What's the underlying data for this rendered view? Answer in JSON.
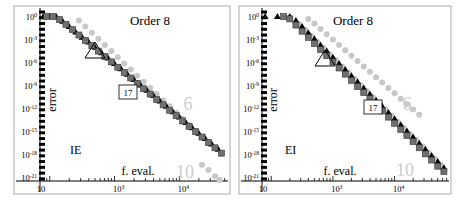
{
  "chart_data": [
    {
      "type": "scatter",
      "title": "Order 8",
      "method_label": "IE",
      "xlabel": "f. eval.",
      "ylabel": "error",
      "xscale": "log",
      "yscale": "log",
      "x_ticks": [
        "10",
        "10^3",
        "10^4"
      ],
      "y_ticks": [
        "10^0",
        "10^-3",
        "10^-6",
        "10^-9",
        "10^-12",
        "10^-15",
        "10^-18",
        "10^-21"
      ],
      "annotations": [
        {
          "text": "6",
          "kind": "gray-label"
        },
        {
          "text": "10",
          "kind": "gray-label"
        },
        {
          "text": "17",
          "kind": "boxed-label"
        },
        {
          "text": "",
          "kind": "triangle-marker"
        }
      ],
      "series": [
        {
          "name": "gray circles (order 6)",
          "marker": "circle",
          "color": "#c8c8c8",
          "log10_x": [
            2.45,
            2.55,
            2.65,
            2.75,
            2.85,
            2.95,
            3.05,
            3.15,
            3.25,
            3.35,
            3.45,
            3.55,
            3.65,
            3.75,
            3.85,
            3.95,
            4.05,
            4.15,
            4.25,
            4.35,
            4.45
          ],
          "log10_y": [
            -0.5,
            -1.3,
            -2.1,
            -2.9,
            -3.7,
            -4.5,
            -5.3,
            -6.1,
            -6.9,
            -7.7,
            -8.5,
            -9.3,
            -10.1,
            -10.9,
            -11.7,
            -12.5,
            -13.3,
            -14.1,
            -14.9,
            -15.7,
            -16.5
          ]
        },
        {
          "name": "gray circles (order 10)",
          "marker": "circle",
          "color": "#c8c8c8",
          "log10_x": [
            4.35,
            4.45,
            4.55,
            4.62
          ],
          "log10_y": [
            -19.3,
            -20.0,
            -20.8,
            -21.3
          ]
        },
        {
          "name": "black triangles",
          "marker": "triangle",
          "color": "#000000",
          "log10_x": [
            1.9,
            2.0,
            2.1,
            2.2,
            2.3,
            2.4,
            2.5,
            2.6,
            2.7,
            2.8,
            2.9,
            3.0,
            3.1,
            3.2,
            3.3,
            3.4,
            3.5,
            3.6,
            3.7,
            3.8,
            3.9,
            4.0,
            4.1,
            4.2,
            4.3,
            4.4,
            4.5,
            4.6
          ],
          "log10_y": [
            0,
            0,
            0,
            -0.6,
            -1.3,
            -2.0,
            -2.7,
            -3.3,
            -4.0,
            -4.7,
            -5.4,
            -6.1,
            -6.8,
            -7.5,
            -8.2,
            -8.9,
            -9.6,
            -10.3,
            -11.0,
            -11.7,
            -12.4,
            -13.1,
            -13.8,
            -14.5,
            -15.2,
            -15.9,
            -16.6,
            -17.3
          ]
        },
        {
          "name": "dark gray squares",
          "marker": "square",
          "color": "#707070",
          "log10_x": [
            1.95,
            2.05,
            2.15,
            2.25,
            2.35,
            2.45,
            2.55,
            2.65,
            2.75,
            2.85,
            2.95,
            3.05,
            3.15,
            3.25,
            3.35,
            3.45,
            3.55,
            3.65,
            3.75,
            3.85,
            3.95,
            4.05,
            4.15,
            4.25,
            4.35,
            4.45,
            4.55,
            4.65
          ],
          "log10_y": [
            0,
            0,
            -0.4,
            -1.0,
            -1.7,
            -2.4,
            -3.1,
            -3.8,
            -4.5,
            -5.2,
            -5.9,
            -6.6,
            -7.3,
            -8.0,
            -8.7,
            -9.4,
            -10.1,
            -10.8,
            -11.5,
            -12.2,
            -12.9,
            -13.6,
            -14.3,
            -15.0,
            -15.7,
            -16.4,
            -17.1,
            -17.8
          ]
        }
      ]
    },
    {
      "type": "scatter",
      "title": "Order 8",
      "method_label": "EI",
      "xlabel": "f. eval.",
      "ylabel": "error",
      "xscale": "log",
      "yscale": "log",
      "x_ticks": [
        "10",
        "10^3",
        "10^4"
      ],
      "y_ticks": [
        "10^0",
        "10^-3",
        "10^-6",
        "10^-9",
        "10^-12",
        "10^-15",
        "10^-18",
        "10^-21"
      ],
      "annotations": [
        {
          "text": "6",
          "kind": "gray-label"
        },
        {
          "text": "10",
          "kind": "gray-label"
        },
        {
          "text": "17",
          "kind": "boxed-label"
        },
        {
          "text": "",
          "kind": "triangle-marker"
        }
      ],
      "series": [
        {
          "name": "gray circles (order 6)",
          "marker": "circle",
          "color": "#c8c8c8",
          "log10_x": [
            2.6,
            2.7,
            2.8,
            2.9,
            3.0,
            3.1,
            3.2,
            3.3,
            3.4,
            3.5,
            3.6,
            3.7,
            3.8,
            3.9,
            4.0,
            4.1,
            4.2,
            4.3,
            4.4
          ],
          "log10_y": [
            -0.3,
            -0.9,
            -1.6,
            -2.3,
            -3.0,
            -3.7,
            -4.4,
            -5.1,
            -5.8,
            -6.5,
            -7.2,
            -7.9,
            -8.6,
            -9.3,
            -10.0,
            -10.7,
            -11.4,
            -12.1,
            -12.8
          ]
        },
        {
          "name": "gray circles (order 10)",
          "marker": "circle",
          "color": "#c8c8c8",
          "log10_x": [
            2.45,
            2.55,
            2.65,
            2.75,
            2.85,
            2.95,
            3.05,
            3.15,
            3.25,
            3.35,
            3.45,
            3.55,
            3.65,
            3.75,
            3.85,
            3.95,
            4.05,
            4.15,
            4.25,
            4.35,
            4.45,
            4.55,
            4.65,
            4.75
          ],
          "log10_y": [
            -1.0,
            -1.7,
            -2.5,
            -3.3,
            -4.1,
            -4.9,
            -5.7,
            -6.5,
            -7.3,
            -8.1,
            -8.9,
            -9.7,
            -10.5,
            -11.3,
            -12.1,
            -12.9,
            -13.7,
            -14.5,
            -15.3,
            -16.1,
            -16.9,
            -17.7,
            -18.5,
            -19.3
          ]
        },
        {
          "name": "black triangles",
          "marker": "triangle",
          "color": "#000000",
          "log10_x": [
            1.9,
            2.1,
            2.3,
            2.4,
            2.5,
            2.6,
            2.7,
            2.8,
            2.9,
            3.0,
            3.1,
            3.2,
            3.3,
            3.4,
            3.5,
            3.6,
            3.7,
            3.8,
            3.9,
            4.0,
            4.1,
            4.2,
            4.3,
            4.4,
            4.5,
            4.6,
            4.7,
            4.8
          ],
          "log10_y": [
            0,
            0,
            0,
            -0.5,
            -1.3,
            -2.1,
            -2.9,
            -3.7,
            -4.5,
            -5.3,
            -6.1,
            -6.9,
            -7.7,
            -8.5,
            -9.3,
            -10.1,
            -10.9,
            -11.7,
            -12.5,
            -13.3,
            -14.1,
            -14.9,
            -15.7,
            -16.5,
            -17.3,
            -18.1,
            -18.9,
            -19.7
          ]
        },
        {
          "name": "dark gray squares",
          "marker": "square",
          "color": "#707070",
          "log10_x": [
            2.2,
            2.3,
            2.4,
            2.5,
            2.6,
            2.7,
            2.8,
            2.9,
            3.0,
            3.1,
            3.2,
            3.3,
            3.4,
            3.5,
            3.6,
            3.7,
            3.8,
            3.9,
            4.0,
            4.1,
            4.2,
            4.3,
            4.4,
            4.5,
            4.6,
            4.7,
            4.8
          ],
          "log10_y": [
            0,
            -0.3,
            -1.1,
            -1.9,
            -2.7,
            -3.5,
            -4.3,
            -5.1,
            -5.9,
            -6.7,
            -7.5,
            -8.3,
            -9.1,
            -9.9,
            -10.7,
            -11.5,
            -12.3,
            -13.1,
            -13.9,
            -14.7,
            -15.5,
            -16.3,
            -17.1,
            -17.9,
            -18.7,
            -19.5,
            -20.2
          ]
        }
      ]
    }
  ],
  "colors": {
    "frame": "#aaaaaa",
    "axis": "#000000",
    "gray_series": "#c8c8c8",
    "square_series": "#707070",
    "triangle_series": "#000000",
    "gray_label": "#cccccc"
  }
}
